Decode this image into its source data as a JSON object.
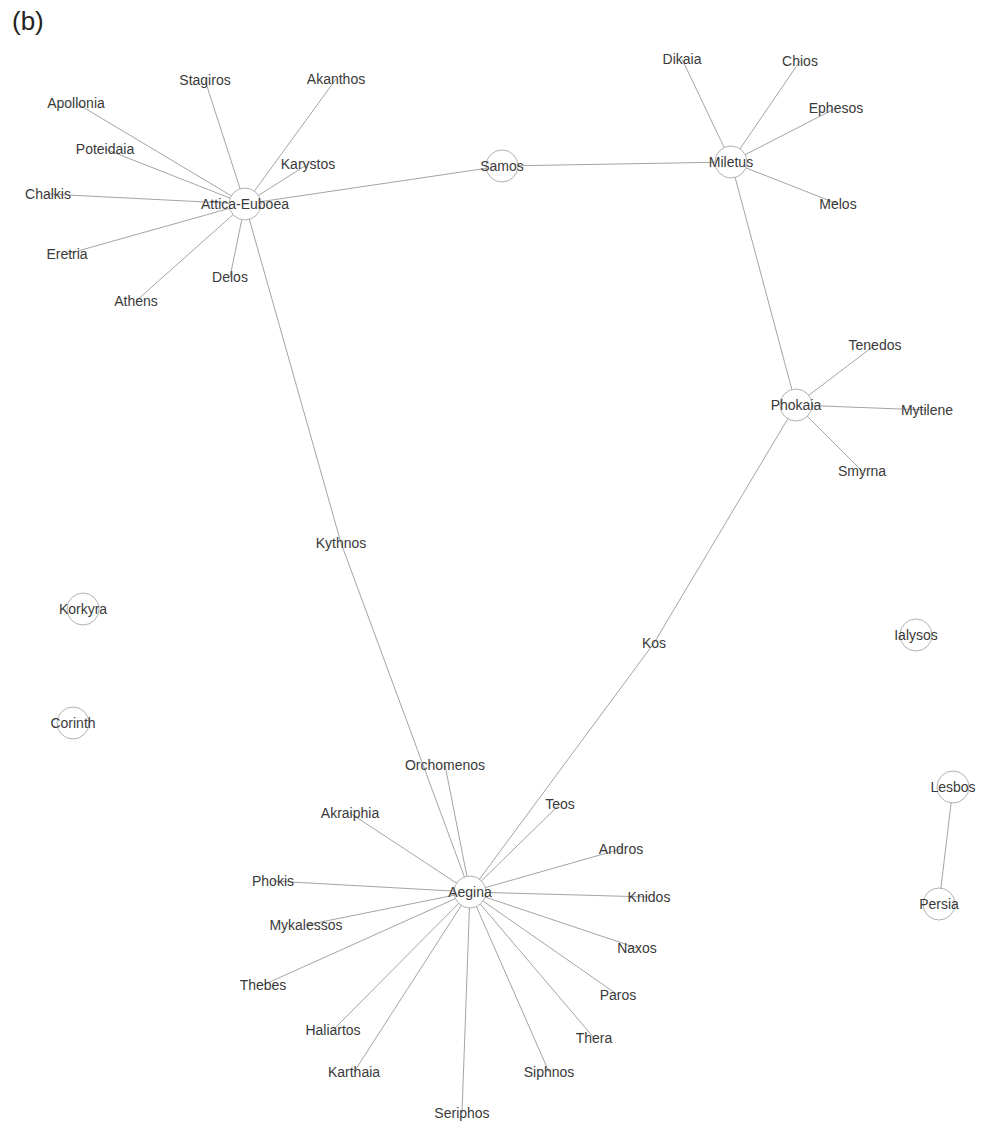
{
  "panel_label": "(b)",
  "graph": {
    "edge_color": "#9a9a9a",
    "node_stroke": "#a8a8a8",
    "label_color": "#3a3a3a",
    "nodes": [
      {
        "id": "Attica-Euboea",
        "x": 245,
        "y": 204,
        "hub": true
      },
      {
        "id": "Samos",
        "x": 502,
        "y": 166,
        "hub": true
      },
      {
        "id": "Miletus",
        "x": 731,
        "y": 162,
        "hub": true
      },
      {
        "id": "Phokaia",
        "x": 796,
        "y": 405,
        "hub": true
      },
      {
        "id": "Aegina",
        "x": 470,
        "y": 892,
        "hub": true
      },
      {
        "id": "Korkyra",
        "x": 83,
        "y": 609,
        "hub": true
      },
      {
        "id": "Corinth",
        "x": 73,
        "y": 723,
        "hub": true
      },
      {
        "id": "Ialysos",
        "x": 916,
        "y": 635,
        "hub": true
      },
      {
        "id": "Lesbos",
        "x": 953,
        "y": 787,
        "hub": true
      },
      {
        "id": "Persia",
        "x": 939,
        "y": 904,
        "hub": true
      },
      {
        "id": "Stagiros",
        "x": 205,
        "y": 80,
        "hub": false
      },
      {
        "id": "Akanthos",
        "x": 336,
        "y": 79,
        "hub": false
      },
      {
        "id": "Apollonia",
        "x": 76,
        "y": 103,
        "hub": false
      },
      {
        "id": "Poteidaia",
        "x": 105,
        "y": 149,
        "hub": false
      },
      {
        "id": "Karystos",
        "x": 308,
        "y": 164,
        "hub": false
      },
      {
        "id": "Chalkis",
        "x": 48,
        "y": 194,
        "hub": false
      },
      {
        "id": "Eretria",
        "x": 67,
        "y": 254,
        "hub": false
      },
      {
        "id": "Delos",
        "x": 230,
        "y": 277,
        "hub": false
      },
      {
        "id": "Athens",
        "x": 136,
        "y": 301,
        "hub": false
      },
      {
        "id": "Dikaia",
        "x": 682,
        "y": 59,
        "hub": false
      },
      {
        "id": "Chios",
        "x": 800,
        "y": 61,
        "hub": false
      },
      {
        "id": "Ephesos",
        "x": 836,
        "y": 108,
        "hub": false
      },
      {
        "id": "Melos",
        "x": 838,
        "y": 204,
        "hub": false
      },
      {
        "id": "Tenedos",
        "x": 875,
        "y": 345,
        "hub": false
      },
      {
        "id": "Mytilene",
        "x": 927,
        "y": 410,
        "hub": false
      },
      {
        "id": "Smyrna",
        "x": 862,
        "y": 471,
        "hub": false
      },
      {
        "id": "Kythnos",
        "x": 341,
        "y": 543,
        "hub": false
      },
      {
        "id": "Kos",
        "x": 654,
        "y": 643,
        "hub": false
      },
      {
        "id": "Orchomenos",
        "x": 445,
        "y": 765,
        "hub": false
      },
      {
        "id": "Akraiphia",
        "x": 350,
        "y": 813,
        "hub": false
      },
      {
        "id": "Teos",
        "x": 560,
        "y": 804,
        "hub": false
      },
      {
        "id": "Andros",
        "x": 621,
        "y": 849,
        "hub": false
      },
      {
        "id": "Phokis",
        "x": 273,
        "y": 881,
        "hub": false
      },
      {
        "id": "Knidos",
        "x": 649,
        "y": 897,
        "hub": false
      },
      {
        "id": "Mykalessos",
        "x": 306,
        "y": 925,
        "hub": false
      },
      {
        "id": "Naxos",
        "x": 637,
        "y": 948,
        "hub": false
      },
      {
        "id": "Thebes",
        "x": 263,
        "y": 985,
        "hub": false
      },
      {
        "id": "Paros",
        "x": 618,
        "y": 995,
        "hub": false
      },
      {
        "id": "Haliartos",
        "x": 333,
        "y": 1030,
        "hub": false
      },
      {
        "id": "Thera",
        "x": 594,
        "y": 1038,
        "hub": false
      },
      {
        "id": "Karthaia",
        "x": 354,
        "y": 1072,
        "hub": false
      },
      {
        "id": "Siphnos",
        "x": 549,
        "y": 1072,
        "hub": false
      },
      {
        "id": "Seriphos",
        "x": 462,
        "y": 1113,
        "hub": false
      }
    ],
    "edges": [
      [
        "Attica-Euboea",
        "Stagiros"
      ],
      [
        "Attica-Euboea",
        "Akanthos"
      ],
      [
        "Attica-Euboea",
        "Apollonia"
      ],
      [
        "Attica-Euboea",
        "Poteidaia"
      ],
      [
        "Attica-Euboea",
        "Karystos"
      ],
      [
        "Attica-Euboea",
        "Chalkis"
      ],
      [
        "Attica-Euboea",
        "Eretria"
      ],
      [
        "Attica-Euboea",
        "Delos"
      ],
      [
        "Attica-Euboea",
        "Athens"
      ],
      [
        "Attica-Euboea",
        "Samos"
      ],
      [
        "Samos",
        "Miletus"
      ],
      [
        "Miletus",
        "Dikaia"
      ],
      [
        "Miletus",
        "Chios"
      ],
      [
        "Miletus",
        "Ephesos"
      ],
      [
        "Miletus",
        "Melos"
      ],
      [
        "Miletus",
        "Phokaia"
      ],
      [
        "Phokaia",
        "Tenedos"
      ],
      [
        "Phokaia",
        "Mytilene"
      ],
      [
        "Phokaia",
        "Smyrna"
      ],
      [
        "Attica-Euboea",
        "Kythnos"
      ],
      [
        "Kythnos",
        "Aegina"
      ],
      [
        "Phokaia",
        "Kos"
      ],
      [
        "Kos",
        "Aegina"
      ],
      [
        "Aegina",
        "Orchomenos"
      ],
      [
        "Aegina",
        "Akraiphia"
      ],
      [
        "Aegina",
        "Teos"
      ],
      [
        "Aegina",
        "Andros"
      ],
      [
        "Aegina",
        "Phokis"
      ],
      [
        "Aegina",
        "Knidos"
      ],
      [
        "Aegina",
        "Mykalessos"
      ],
      [
        "Aegina",
        "Naxos"
      ],
      [
        "Aegina",
        "Thebes"
      ],
      [
        "Aegina",
        "Paros"
      ],
      [
        "Aegina",
        "Haliartos"
      ],
      [
        "Aegina",
        "Thera"
      ],
      [
        "Aegina",
        "Karthaia"
      ],
      [
        "Aegina",
        "Siphnos"
      ],
      [
        "Aegina",
        "Seriphos"
      ],
      [
        "Lesbos",
        "Persia"
      ]
    ]
  }
}
